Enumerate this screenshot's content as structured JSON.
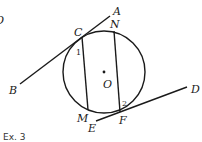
{
  "figure": {
    "caption": "Ex. 3",
    "stray_mark": "O",
    "colors": {
      "ink": "#1a1a1a",
      "background": "#ffffff"
    },
    "circle": {
      "center_label": "O",
      "cx": 104,
      "cy": 72,
      "r": 41
    },
    "points": {
      "A": "A",
      "N": "N",
      "C": "C",
      "B": "B",
      "D": "D",
      "M": "M",
      "E": "E",
      "F": "F",
      "O": "O"
    },
    "angles": {
      "angle1": "1",
      "angle2": "2"
    },
    "lines": [
      {
        "name": "tangent-AB",
        "from": "B",
        "to": "A",
        "note": "tangent at C"
      },
      {
        "name": "tangent-ED",
        "from": "E",
        "to": "D",
        "note": "tangent at F"
      },
      {
        "name": "chord-CM",
        "from": "C",
        "to": "M"
      },
      {
        "name": "chord-NF",
        "from": "N",
        "to": "F"
      }
    ]
  }
}
